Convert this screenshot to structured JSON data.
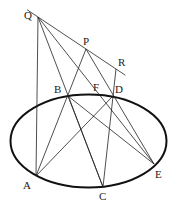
{
  "diagram": {
    "points": [
      {
        "id": "Q",
        "label": "Q"
      },
      {
        "id": "P",
        "label": "P"
      },
      {
        "id": "R",
        "label": "R"
      },
      {
        "id": "B",
        "label": "B"
      },
      {
        "id": "F",
        "label": "F"
      },
      {
        "id": "D",
        "label": "D"
      },
      {
        "id": "A",
        "label": "A"
      },
      {
        "id": "C",
        "label": "C"
      },
      {
        "id": "E",
        "label": "E"
      }
    ],
    "segments": [
      [
        "Q",
        "R",
        "extended"
      ],
      [
        "Q",
        "A"
      ],
      [
        "Q",
        "C"
      ],
      [
        "Q",
        "E"
      ],
      [
        "P",
        "A"
      ],
      [
        "P",
        "E"
      ],
      [
        "R",
        "C"
      ],
      [
        "B",
        "C"
      ],
      [
        "A",
        "D"
      ],
      [
        "B",
        "E"
      ]
    ],
    "conic": "ellipse"
  }
}
